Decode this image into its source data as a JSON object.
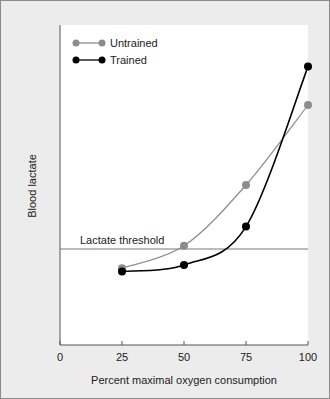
{
  "chart_data": {
    "type": "line",
    "title": "",
    "xlabel": "Percent maximal oxygen consumption",
    "ylabel": "Blood lactate",
    "x": [
      25,
      50,
      75,
      100
    ],
    "xticks": [
      "0",
      "25",
      "50",
      "75",
      "100"
    ],
    "xlim": [
      0,
      100
    ],
    "ylim": [
      0,
      100
    ],
    "series": [
      {
        "name": "Untrained",
        "color": "#8c8c8c",
        "values": [
          24,
          31,
          50,
          75
        ]
      },
      {
        "name": "Trained",
        "color": "#000000",
        "values": [
          23,
          25,
          37,
          87
        ]
      }
    ],
    "annotations": [
      {
        "text": "Lactate threshold",
        "y": 30
      }
    ],
    "legend_position": "top-left",
    "grid": false
  }
}
